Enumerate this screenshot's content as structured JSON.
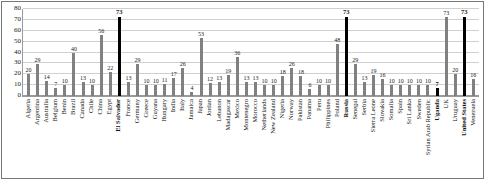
{
  "chart_data": {
    "type": "bar",
    "title": "",
    "xlabel": "",
    "ylabel": "",
    "ylim": [
      0,
      80
    ],
    "yticks": [
      0,
      10,
      20,
      30,
      40,
      50,
      60,
      70,
      80
    ],
    "grid": true,
    "legend": "none",
    "bar_color": "#808080",
    "highlight_color": "#000000",
    "highlighted": [
      "El Salvador",
      "Russia",
      "Uganda",
      "United States"
    ],
    "categories": [
      "Algeria",
      "Argentina",
      "Australia",
      "Belgium",
      "Benin",
      "Brazil",
      "Canada",
      "Chile",
      "China",
      "Egypt",
      "El Salvador",
      "France",
      "Germany",
      "Greece",
      "Guyana",
      "Hungary",
      "India",
      "Italy",
      "Jamaica",
      "Japan",
      "Jordan",
      "Lebanon",
      "Madagascar",
      "Mexico",
      "Montenegro",
      "Morocco",
      "Netherlands",
      "New Zealand",
      "Nigeria",
      "Norway",
      "Pakistan",
      "Panama",
      "Peru",
      "Philippines",
      "Poland",
      "Russia",
      "Senegal",
      "Serbia",
      "Sierra Leone",
      "Slovakia",
      "Somalia",
      "Spain",
      "Sri Lanka",
      "Sweden",
      "Syrian Arab Republic",
      "Uganda",
      "UK",
      "Uruguay",
      "United States",
      "Venezuela"
    ],
    "values": [
      20,
      29,
      14,
      7,
      10,
      40,
      13,
      10,
      56,
      22,
      73,
      13,
      29,
      10,
      10,
      11,
      17,
      26,
      4,
      53,
      12,
      13,
      19,
      36,
      13,
      13,
      10,
      10,
      18,
      26,
      18,
      6,
      10,
      10,
      48,
      73,
      29,
      13,
      19,
      16,
      10,
      10,
      10,
      10,
      10,
      7,
      73,
      20,
      73,
      16
    ]
  }
}
